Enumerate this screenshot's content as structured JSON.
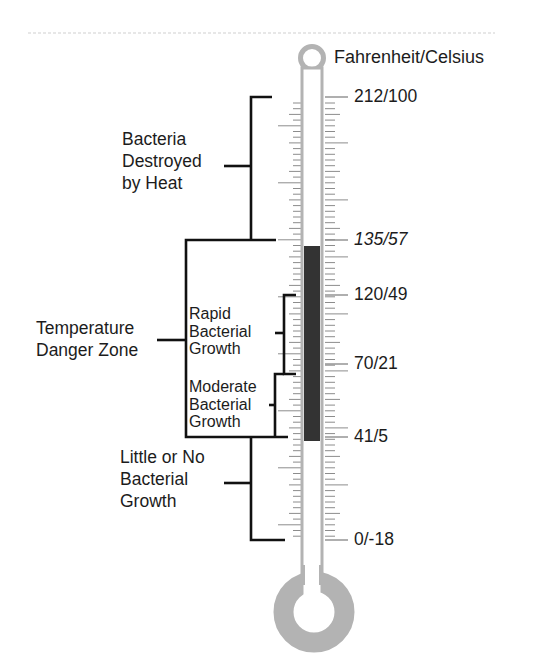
{
  "diagram": {
    "title": "Fahrenheit/Celsius",
    "colors": {
      "tube": "#b3b3b3",
      "fill": "#333333",
      "bracket": "#111111",
      "tick": "#8c8c8c",
      "divider": "#cccccc"
    },
    "scale_labels": [
      {
        "text": "212/100",
        "y": 97,
        "italic": false
      },
      {
        "text": "135/57",
        "y": 240,
        "italic": true
      },
      {
        "text": "120/49",
        "y": 295,
        "italic": false
      },
      {
        "text": "70/21",
        "y": 364,
        "italic": false
      },
      {
        "text": "41/5",
        "y": 437,
        "italic": false
      },
      {
        "text": "0/-18",
        "y": 540,
        "italic": false
      }
    ],
    "zones": [
      {
        "id": "destroyed",
        "lines": [
          "Bacteria",
          "Destroyed",
          "by Heat"
        ]
      },
      {
        "id": "danger",
        "lines": [
          "Temperature",
          "Danger Zone"
        ]
      },
      {
        "id": "rapid",
        "lines": [
          "Rapid",
          "Bacterial",
          "Growth"
        ]
      },
      {
        "id": "moderate",
        "lines": [
          "Moderate",
          "Bacterial",
          "Growth"
        ]
      },
      {
        "id": "little",
        "lines": [
          "Little or No",
          "Bacterial",
          "Growth"
        ]
      }
    ],
    "fill_range": {
      "top": 246,
      "bottom": 441
    }
  }
}
